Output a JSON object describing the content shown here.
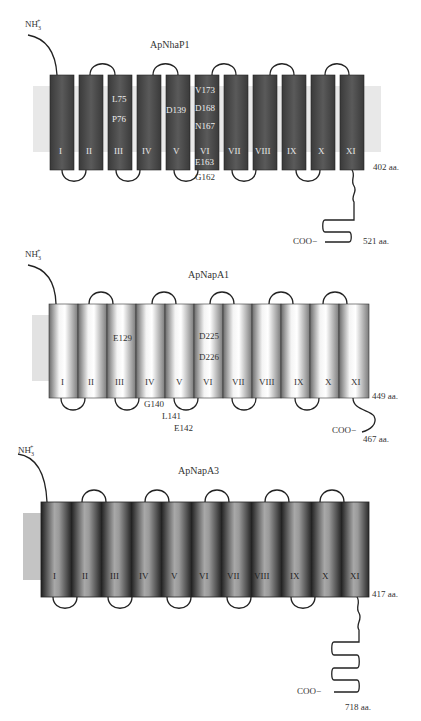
{
  "figure": {
    "panels": [
      {
        "id": "apnhap1",
        "title": "ApNhaP1",
        "n_terminus": "NH3+",
        "c_terminus": "COO−",
        "helices": [
          "I",
          "II",
          "III",
          "IV",
          "V",
          "VI",
          "VII",
          "VIII",
          "IX",
          "X",
          "XI"
        ],
        "end_label": "402 aa.",
        "c_end_label": "521 aa.",
        "residues": [
          {
            "helix": "III",
            "label": "L75"
          },
          {
            "helix": "III",
            "label": "P76"
          },
          {
            "helix": "V",
            "label": "D139"
          },
          {
            "helix": "VI",
            "label": "V173"
          },
          {
            "helix": "VI",
            "label": "D168"
          },
          {
            "helix": "VI",
            "label": "N167"
          },
          {
            "helix": "VI",
            "label": "E163"
          },
          {
            "helix": "VI",
            "label": "G162"
          }
        ]
      },
      {
        "id": "apnapa1",
        "title": "ApNapA1",
        "n_terminus": "NH3+",
        "c_terminus": "COO−",
        "helices": [
          "I",
          "II",
          "III",
          "IV",
          "V",
          "VI",
          "VII",
          "VIII",
          "IX",
          "X",
          "XI"
        ],
        "end_label": "449 aa.",
        "c_end_label": "467 aa.",
        "residues": [
          {
            "helix": "III",
            "label": "E129"
          },
          {
            "helix": "VI",
            "label": "D225"
          },
          {
            "helix": "VI",
            "label": "D226"
          },
          {
            "helix": "IV-V loop",
            "label": "G140"
          },
          {
            "helix": "IV-V loop",
            "label": "L141"
          },
          {
            "helix": "IV-V loop",
            "label": "E142"
          }
        ]
      },
      {
        "id": "apnapa3",
        "title": "ApNapA3",
        "n_terminus": "NH3+",
        "c_terminus": "COO−",
        "helices": [
          "I",
          "II",
          "III",
          "IV",
          "V",
          "VI",
          "VII",
          "VIII",
          "IX",
          "X",
          "XI"
        ],
        "end_label": "417 aa.",
        "c_end_label": "718 aa."
      }
    ],
    "colors": {
      "dark_helix": "#4a4a4a",
      "membrane": "#e6e6e6",
      "membrane_side": "#c8c8c8",
      "line": "#2a2a2a"
    }
  }
}
